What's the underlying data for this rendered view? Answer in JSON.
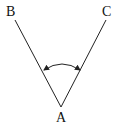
{
  "diagram": {
    "type": "angle",
    "points": {
      "A": {
        "label": "A",
        "x": 61,
        "y": 107
      },
      "B": {
        "label": "B",
        "x": 15,
        "y": 20
      },
      "C": {
        "label": "C",
        "x": 106,
        "y": 20
      }
    },
    "rays": [
      {
        "from": "A",
        "to": "B"
      },
      {
        "from": "A",
        "to": "C"
      }
    ],
    "angle_marker": {
      "vertex": "A",
      "style": "double-headed arc arrow",
      "start": {
        "x": 44,
        "y": 70
      },
      "end": {
        "x": 80,
        "y": 70
      },
      "peak_y": 63
    },
    "colors": {
      "line": "#222222",
      "text": "#111111",
      "background": "#ffffff"
    }
  }
}
